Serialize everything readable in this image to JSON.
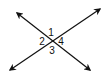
{
  "diagram": {
    "type": "intersecting-lines",
    "stroke_color": "#111111",
    "background": "#ffffff",
    "lines": [
      {
        "name": "line-a",
        "from": [
          17,
          13
        ],
        "to": [
          90,
          70
        ],
        "arrows": "both"
      },
      {
        "name": "line-b",
        "from": [
          10,
          70
        ],
        "to": [
          100,
          9
        ],
        "arrows": "both"
      }
    ],
    "intersection": [
      53,
      40
    ],
    "angle_labels": [
      {
        "id": "angle-1",
        "text": "1",
        "x": 51,
        "y": 36
      },
      {
        "id": "angle-2",
        "text": "2",
        "x": 42,
        "y": 45
      },
      {
        "id": "angle-4",
        "text": "4",
        "x": 61,
        "y": 45
      },
      {
        "id": "angle-3",
        "text": "3",
        "x": 52,
        "y": 54
      }
    ]
  }
}
